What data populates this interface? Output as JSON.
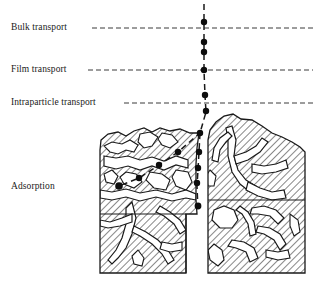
{
  "figure": {
    "type": "schematic-diagram",
    "width": 315,
    "height": 286,
    "background_color": "#ffffff",
    "line_color": "#1a1a1a",
    "dash_color": "#3a3a3a",
    "hatch_color": "#1a1a1a"
  },
  "labels": {
    "bulk_transport": "Bulk transport",
    "film_transport": "Film transport",
    "intraparticle_transport": "Intraparticle transport",
    "adsorption": "Adsorption"
  },
  "zones": [
    {
      "name": "bulk-transport",
      "label": "Bulk transport",
      "boundary_y": 28
    },
    {
      "name": "film-transport",
      "label": "Film transport",
      "boundary_y": 70
    },
    {
      "name": "intraparticle-transport",
      "label": "Intraparticle transport",
      "boundary_y": 103
    },
    {
      "name": "adsorption",
      "label": "Adsorption",
      "boundary_y": null
    }
  ],
  "boundary_lines": [
    {
      "name": "bulk-transport-boundary",
      "y": 28,
      "x1": 92,
      "x2": 313
    },
    {
      "name": "film-transport-boundary",
      "y": 70,
      "x1": 88,
      "x2": 313
    },
    {
      "name": "intraparticle-transport-boundary",
      "y": 103,
      "x1": 124,
      "x2": 313
    }
  ],
  "adsorbate_path": {
    "name": "adsorbate-trajectory",
    "style": "dashed",
    "points": [
      {
        "x": 204,
        "y": 6
      },
      {
        "x": 204,
        "y": 22
      },
      {
        "x": 204,
        "y": 42
      },
      {
        "x": 204,
        "y": 52
      },
      {
        "x": 204,
        "y": 70
      },
      {
        "x": 205,
        "y": 95
      },
      {
        "x": 206,
        "y": 111
      },
      {
        "x": 200,
        "y": 133
      },
      {
        "x": 199,
        "y": 152
      },
      {
        "x": 198,
        "y": 168
      },
      {
        "x": 197,
        "y": 183
      },
      {
        "x": 198,
        "y": 206
      }
    ]
  },
  "adsorbate_branch_path": {
    "name": "adsorbate-branch-trajectory",
    "style": "dashed",
    "points": [
      {
        "x": 200,
        "y": 133
      },
      {
        "x": 178,
        "y": 152
      },
      {
        "x": 159,
        "y": 165
      },
      {
        "x": 139,
        "y": 178
      },
      {
        "x": 119,
        "y": 186
      }
    ]
  },
  "molecule_dots": [
    {
      "name": "dot-bulk-1",
      "x": 204,
      "y": 22,
      "r": 3.2
    },
    {
      "name": "dot-bulk-2",
      "x": 204,
      "y": 42,
      "r": 3.2
    },
    {
      "name": "dot-bulk-3",
      "x": 204,
      "y": 52,
      "r": 3.2
    },
    {
      "name": "dot-film-1",
      "x": 204,
      "y": 70,
      "r": 3.2
    },
    {
      "name": "dot-film-2",
      "x": 205,
      "y": 95,
      "r": 3.2
    },
    {
      "name": "dot-intraparticle-1",
      "x": 206,
      "y": 111,
      "r": 3.2
    },
    {
      "name": "dot-intraparticle-2",
      "x": 200,
      "y": 133,
      "r": 3.2
    },
    {
      "name": "dot-intraparticle-3",
      "x": 199,
      "y": 152,
      "r": 3.2
    },
    {
      "name": "dot-intraparticle-4",
      "x": 198,
      "y": 168,
      "r": 3.2
    },
    {
      "name": "dot-intraparticle-5",
      "x": 197,
      "y": 183,
      "r": 3.2
    },
    {
      "name": "dot-intraparticle-6",
      "x": 198,
      "y": 206,
      "r": 3.2
    },
    {
      "name": "dot-adsorption-1",
      "x": 178,
      "y": 152,
      "r": 3.2
    },
    {
      "name": "dot-adsorption-2",
      "x": 159,
      "y": 165,
      "r": 3.2
    },
    {
      "name": "dot-adsorption-3",
      "x": 139,
      "y": 178,
      "r": 3.2
    },
    {
      "name": "dot-adsorption-4",
      "x": 119,
      "y": 186,
      "r": 3.8
    }
  ],
  "particle": {
    "name": "adsorbent-particle",
    "fill": "hatched",
    "left_block_bounds": {
      "x1": 100,
      "y1": 128,
      "x2": 205,
      "y2": 273
    },
    "right_block_bounds": {
      "x1": 207,
      "y1": 114,
      "x2": 306,
      "y2": 273
    },
    "description": "Two hatched solid halves separated by a vertical macropore with branching internal pore network"
  }
}
